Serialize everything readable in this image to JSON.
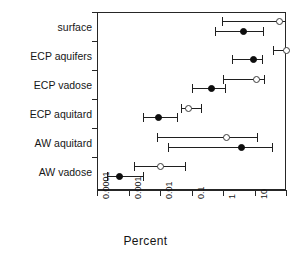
{
  "chart_data": {
    "type": "scatter",
    "title": "",
    "xlabel": "Percent",
    "ylabel": "",
    "xscale": "log",
    "xlim": [
      0.0001,
      100
    ],
    "grid": false,
    "legend": null,
    "xticks": [
      0.0001,
      0.001,
      0.01,
      0.1,
      1,
      10,
      100
    ],
    "xtick_labels": [
      "0.0001",
      "0.001",
      "0.01",
      "0.1",
      "1",
      "10",
      "100"
    ],
    "categories": [
      "surface",
      "ECP  aquifers",
      "ECP vadose",
      "ECP  aquitard",
      "AW  aquitard",
      "AW vadose"
    ],
    "series": [
      {
        "name": "open",
        "marker": "open-circle",
        "values": [
          60,
          110,
          12,
          0.08,
          1.3,
          0.01
        ],
        "low": [
          0.95,
          40,
          1.0,
          0.045,
          0.008,
          0.0015
        ],
        "high": [
          100,
          120,
          20,
          0.2,
          12,
          0.06
        ]
      },
      {
        "name": "filled",
        "marker": "filled-circle",
        "values": [
          4.5,
          9.5,
          0.42,
          0.009,
          4.0,
          0.0005
        ],
        "low": [
          0.55,
          2.0,
          0.1,
          0.0028,
          0.018,
          0.00021
        ],
        "high": [
          18,
          17,
          1.2,
          0.035,
          35,
          0.0028
        ]
      }
    ]
  },
  "axis": {
    "x_title": "Percent",
    "tick_labels": [
      "0.0001",
      "0.001",
      "0.01",
      "0.1",
      "1",
      "10",
      "100"
    ]
  },
  "colors": {
    "frame": "#262626",
    "marker_filled": "#0d0d0d",
    "marker_open_edge": "#3a3a3a",
    "whisker": "#1f1f1f",
    "background": "#ffffff",
    "text": "#161616"
  }
}
